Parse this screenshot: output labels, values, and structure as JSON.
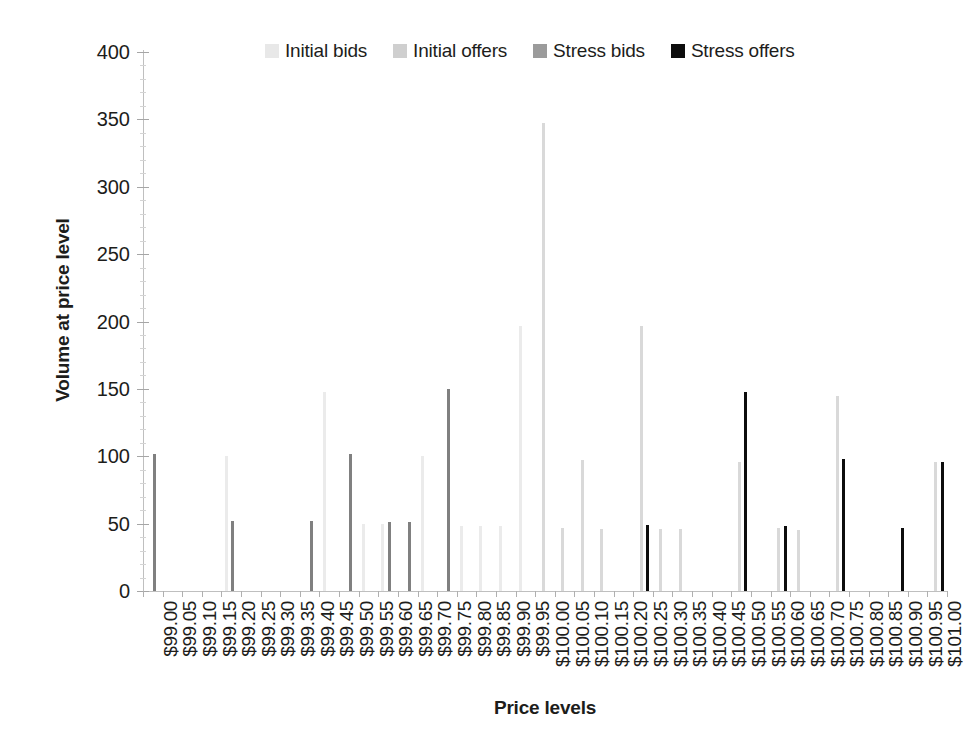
{
  "chart_data": {
    "type": "bar",
    "title": "",
    "xlabel": "Price levels",
    "ylabel": "Volume at price level",
    "ylim": [
      0,
      400
    ],
    "ytick_step": 50,
    "yticks": [
      0,
      50,
      100,
      150,
      200,
      250,
      300,
      350,
      400
    ],
    "grid": false,
    "legend_position": "top",
    "categories": [
      "$99.00",
      "$99.05",
      "$99.10",
      "$99.15",
      "$99.20",
      "$99.25",
      "$99.30",
      "$99.35",
      "$99.40",
      "$99.45",
      "$99.50",
      "$99.55",
      "$99.60",
      "$99.65",
      "$99.70",
      "$99.75",
      "$99.80",
      "$99.85",
      "$99.90",
      "$99.95",
      "$100.00",
      "$100.05",
      "$100.10",
      "$100.15",
      "$100.20",
      "$100.25",
      "$100.30",
      "$100.35",
      "$100.40",
      "$100.45",
      "$100.50",
      "$100.55",
      "$100.60",
      "$100.65",
      "$100.70",
      "$100.75",
      "$100.80",
      "$100.85",
      "$100.90",
      "$100.95",
      "$101.00"
    ],
    "series": [
      {
        "name": "Initial bids",
        "color": "#ebebeb",
        "values": [
          0,
          0,
          0,
          0,
          100,
          0,
          0,
          0,
          0,
          148,
          0,
          50,
          50,
          0,
          100,
          0,
          48,
          48,
          48,
          197,
          0,
          0,
          0,
          0,
          0,
          0,
          0,
          0,
          0,
          0,
          0,
          0,
          0,
          0,
          0,
          0,
          0,
          0,
          0,
          0,
          0
        ]
      },
      {
        "name": "Initial offers",
        "color": "#d9d9d9",
        "values": [
          0,
          0,
          0,
          0,
          0,
          0,
          0,
          0,
          0,
          0,
          0,
          0,
          0,
          0,
          0,
          0,
          0,
          0,
          0,
          0,
          347,
          47,
          97,
          46,
          0,
          197,
          46,
          46,
          0,
          0,
          96,
          0,
          47,
          45,
          0,
          145,
          0,
          0,
          0,
          0,
          96
        ]
      },
      {
        "name": "Stress bids",
        "color": "#808080",
        "values": [
          102,
          0,
          0,
          0,
          52,
          0,
          0,
          0,
          52,
          0,
          102,
          0,
          51,
          51,
          0,
          150,
          0,
          0,
          0,
          0,
          0,
          0,
          0,
          0,
          0,
          0,
          0,
          0,
          0,
          0,
          0,
          0,
          0,
          0,
          0,
          0,
          0,
          0,
          0,
          0,
          0
        ]
      },
      {
        "name": "Stress offers",
        "color": "#0d0d0d",
        "values": [
          0,
          0,
          0,
          0,
          0,
          0,
          0,
          0,
          0,
          0,
          0,
          0,
          0,
          0,
          0,
          0,
          0,
          0,
          0,
          0,
          0,
          0,
          0,
          0,
          0,
          49,
          0,
          0,
          0,
          0,
          148,
          0,
          48,
          0,
          0,
          98,
          0,
          0,
          47,
          0,
          96
        ]
      }
    ]
  },
  "legend": {
    "entries": [
      {
        "label": "Initial bids",
        "color": "#e8e8e8"
      },
      {
        "label": "Initial offers",
        "color": "#cfcfcf"
      },
      {
        "label": "Stress bids",
        "color": "#9b9b9b"
      },
      {
        "label": "Stress offers",
        "color": "#0d0d0d"
      }
    ]
  },
  "axes": {
    "y_title": "Volume at price level",
    "x_title": "Price levels"
  }
}
